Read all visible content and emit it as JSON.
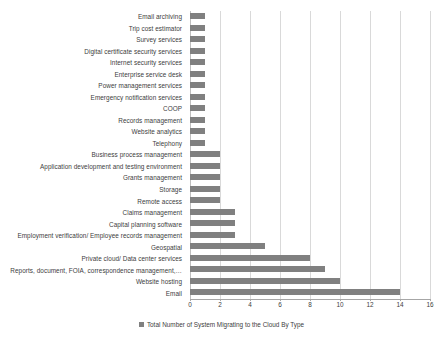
{
  "chart_data": {
    "type": "bar",
    "orientation": "horizontal",
    "title": "",
    "xlabel": "",
    "ylabel": "",
    "xlim": [
      0,
      16
    ],
    "xticks": [
      0,
      2,
      4,
      6,
      8,
      10,
      12,
      14,
      16
    ],
    "grid": true,
    "legend_position": "bottom",
    "legend": [
      "Total Number of System Migrating to the Cloud By Type"
    ],
    "series_color": "#808080",
    "gridline_color": "#d9d9d9",
    "categories": [
      "Email archiving",
      "Trip cost estimator",
      "Survey services",
      "Digital certificate security services",
      "Internet security services",
      "Enterprise service desk",
      "Power management services",
      "Emergency notification services",
      "COOP",
      "Records management",
      "Website analytics",
      "Telephony",
      "Business process management",
      "Application development and testing environment",
      "Grants management",
      "Storage",
      "Remote access",
      "Claims management",
      "Capital planning software",
      "Employment verification/ Employee records management",
      "Geospatial",
      "Private cloud/ Data center services",
      "Reports, document, FOIA, correspondence management,…",
      "Website hosting",
      "Email"
    ],
    "values": [
      1,
      1,
      1,
      1,
      1,
      1,
      1,
      1,
      1,
      1,
      1,
      1,
      2,
      2,
      2,
      2,
      2,
      3,
      3,
      3,
      5,
      8,
      9,
      10,
      14
    ]
  }
}
